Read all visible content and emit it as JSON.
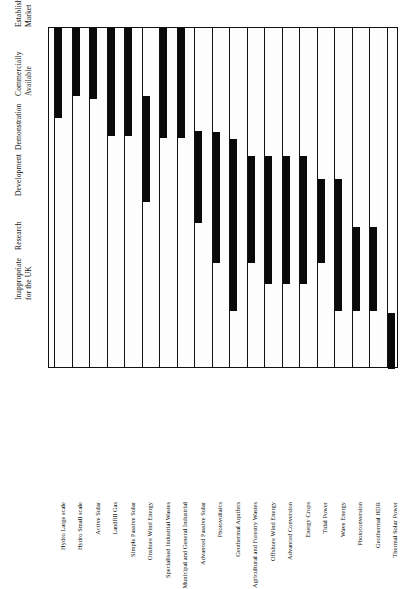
{
  "figure": {
    "background_color": "#ffffff",
    "bar_color": "#0a0a0a",
    "axis_color": "#111111",
    "orientation": "rotated-90"
  },
  "chart_data": {
    "type": "bar",
    "title": "",
    "subtitle": "",
    "xlabel": "",
    "ylabel": "",
    "grid": true,
    "legend_position": "none",
    "orientation": "horizontal-range",
    "stages": [
      "Inappropriate for the UK",
      "Research",
      "Development",
      "Demonstration",
      "Commercially Available",
      "Established Market"
    ],
    "stage_headers": [
      {
        "line1": "Established",
        "line2": "Market"
      },
      {
        "line1": "Commercially",
        "line2": "Available"
      },
      {
        "line1": "Demonstration",
        "line2": ""
      },
      {
        "line1": "Development",
        "line2": ""
      },
      {
        "line1": "Research",
        "line2": ""
      },
      {
        "line1": "Inappropriate",
        "line2": "for the UK"
      }
    ],
    "categories": [
      "Hydro Large scale",
      "Hydro Small scale",
      "Active Solar",
      "Landfill Gas",
      "Simple Passive Solar",
      "Onshore Wind Energy",
      "Specialised Industrial Wastes",
      "Municipal and General Industrial",
      "Advanced Passive Solar",
      "Photovoltaics",
      "Geothermal Aquifers",
      "Agricultural and Forestry Wastes",
      "Offshore Wind Energy",
      "Advanced Conversion",
      "Energy Crops",
      "Tidal Power",
      "Wave Energy",
      "Photoconversion",
      "Geothermal HDR",
      "Thermal Solar Power"
    ],
    "bars": [
      {
        "category": "Hydro Large scale",
        "start_stage": "Commercially Available",
        "end_stage": "Established Market",
        "start_frac": 0.0,
        "end_frac": 0.264
      },
      {
        "category": "Hydro Small scale",
        "start_stage": "Commercially Available",
        "end_stage": "Established Market",
        "start_frac": 0.0,
        "end_frac": 0.2
      },
      {
        "category": "Active Solar",
        "start_stage": "Commercially Available",
        "end_stage": "Established Market",
        "start_frac": 0.0,
        "end_frac": 0.209
      },
      {
        "category": "Landfill Gas",
        "start_stage": "Demonstration",
        "end_stage": "Established Market",
        "start_frac": 0.0,
        "end_frac": 0.317
      },
      {
        "category": "Simple Passive Solar",
        "start_stage": "Demonstration",
        "end_stage": "Established Market",
        "start_frac": 0.0,
        "end_frac": 0.317
      },
      {
        "category": "Onshore Wind Energy",
        "start_stage": "Demonstration",
        "end_stage": "Commercially Available",
        "start_frac": 0.199,
        "end_frac": 0.51
      },
      {
        "category": "Specialised Industrial Wastes",
        "start_stage": "Demonstration",
        "end_stage": "Established Market",
        "start_frac": 0.0,
        "end_frac": 0.323
      },
      {
        "category": "Municipal and General Industrial",
        "start_stage": "Demonstration",
        "end_stage": "Established Market",
        "start_frac": 0.0,
        "end_frac": 0.323
      },
      {
        "category": "Advanced Passive Solar",
        "start_stage": "Development",
        "end_stage": "Demonstration",
        "start_frac": 0.302,
        "end_frac": 0.572
      },
      {
        "category": "Photovoltaics",
        "start_stage": "Development",
        "end_stage": "Demonstration",
        "start_frac": 0.305,
        "end_frac": 0.689
      },
      {
        "category": "Geothermal Aquifers",
        "start_stage": "Research",
        "end_stage": "Demonstration",
        "start_frac": 0.326,
        "end_frac": 0.83
      },
      {
        "category": "Agricultural and Forestry Wastes",
        "start_stage": "Development",
        "end_stage": "Demonstration",
        "start_frac": 0.375,
        "end_frac": 0.689
      },
      {
        "category": "Offshore Wind Energy",
        "start_stage": "Development",
        "end_stage": "Demonstration",
        "start_frac": 0.375,
        "end_frac": 0.751
      },
      {
        "category": "Advanced Conversion",
        "start_stage": "Development",
        "end_stage": "Demonstration",
        "start_frac": 0.375,
        "end_frac": 0.751
      },
      {
        "category": "Energy Crops",
        "start_stage": "Development",
        "end_stage": "Demonstration",
        "start_frac": 0.375,
        "end_frac": 0.751
      },
      {
        "category": "Tidal Power",
        "start_stage": "Development",
        "end_stage": "Demonstration",
        "start_frac": 0.443,
        "end_frac": 0.689
      },
      {
        "category": "Wave Energy",
        "start_stage": "Research",
        "end_stage": "Demonstration",
        "start_frac": 0.443,
        "end_frac": 0.83
      },
      {
        "category": "Photoconversion",
        "start_stage": "Research",
        "end_stage": "Development",
        "start_frac": 0.583,
        "end_frac": 0.83
      },
      {
        "category": "Geothermal HDR",
        "start_stage": "Research",
        "end_stage": "Development",
        "start_frac": 0.583,
        "end_frac": 0.83
      },
      {
        "category": "Thermal Solar Power",
        "start_stage": "Inappropriate for the UK",
        "end_stage": "Inappropriate for the UK",
        "start_frac": 0.836,
        "end_frac": 1.0
      }
    ]
  }
}
